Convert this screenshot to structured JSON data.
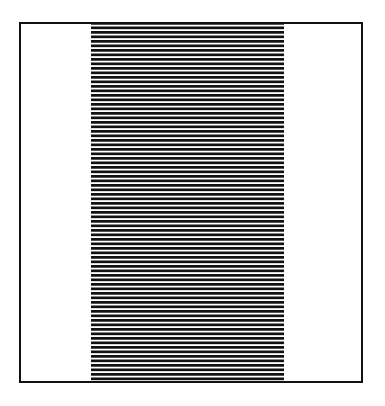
{
  "figure": {
    "background_color": "#ffffff",
    "canvas": {
      "width": 385,
      "height": 406
    },
    "frame": {
      "name": "rectangular-border",
      "stroke_color": "#111111",
      "stroke_width": 2,
      "x": 19,
      "y": 22,
      "width": 344,
      "height": 361,
      "fill_color": "#ffffff"
    },
    "stripe_band": {
      "name": "horizontal-stripe-band",
      "x": 91,
      "y": 22,
      "width": 193,
      "height": 361,
      "orientation": "horizontal",
      "line_color": "#111111",
      "gap_color": "#ffffff",
      "line_thickness": 2.4,
      "gap_thickness": 2.1,
      "period": 4.5,
      "line_count": 80
    },
    "margins": {
      "left_white_width": 70,
      "right_white_width": 77
    },
    "caption": ""
  },
  "chart_data": {
    "type": "bar",
    "xlabel": "",
    "ylabel": "",
    "categories": [
      "left margin",
      "striped band",
      "right margin"
    ],
    "values": [
      70,
      193,
      77
    ]
  }
}
